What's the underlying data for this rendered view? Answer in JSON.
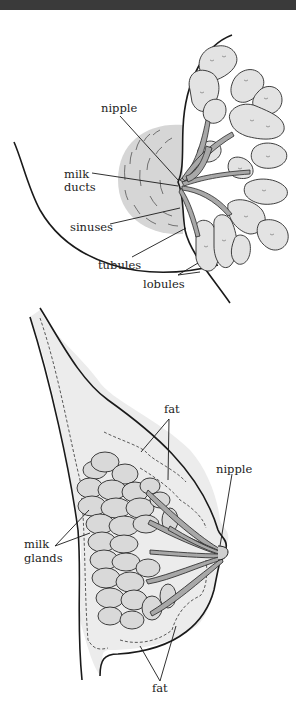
{
  "diagram": {
    "top_figure": {
      "description": "Side view of breast lobes and ducts",
      "labels": {
        "nipple": "nipple",
        "milk_ducts_1": "milk",
        "milk_ducts_2": "ducts",
        "sinuses": "sinuses",
        "tubules": "tubules",
        "lobules": "lobules"
      }
    },
    "bottom_figure": {
      "description": "Cross-section of breast showing fat and milk glands",
      "labels": {
        "fat_top": "fat",
        "nipple": "nipple",
        "milk_glands_1": "milk",
        "milk_glands_2": "glands",
        "fat_bottom": "fat"
      }
    },
    "colors": {
      "fill_light": "#e6e6e6",
      "fill_mid": "#d2d2d2",
      "duct_fill": "#a8a8a8",
      "line": "#1a1a1a",
      "top_bar": "#3a3a3a"
    }
  }
}
